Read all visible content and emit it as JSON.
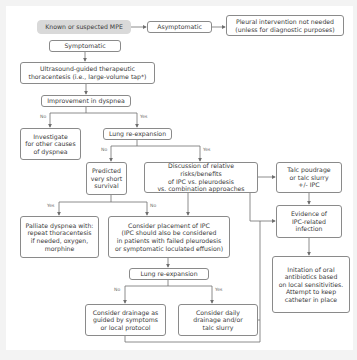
{
  "diagram": {
    "nodes": {
      "mpe": "Known or suspected MPE",
      "asymptomatic": "Asymptomatic",
      "no_intervention": "Pleural intervention not needed\n(unless for diagnostic purposes)",
      "symptomatic": "Symptomatic",
      "thoracentesis": "Ultrasound-guided therapeutic\nthoracentesis (i.e., large-volume tap*)",
      "improvement": "Improvement in dyspnea",
      "investigate": "Investigate\nfor other causes\nof dyspnea",
      "lung_reexp_1": "Lung re-expansion",
      "predicted_survival": "Predicted\nvery short\nsurvival",
      "discussion": "Discussion of relative risks/benefits\nof IPC vs. pleurodesis\nvs. combination approaches",
      "talc": "Talc poudrage\nor talc slurry\n+/- IPC",
      "evidence_infection": "Evidence of\nIPC-related\ninfection",
      "palliate": "Palliate dyspnea with:\nrepeat thoracentesis\nif needed, oxygen,\nmorphine",
      "consider_ipc": "Consider placement of IPC\n(IPC should also be considered\nin patients with failed pleurodesis\nor symptomatic loculated effusion)",
      "lung_reexp_2": "Lung re-expansion",
      "antibiotics": "Initation of oral\nantibiotics based\non local sensitivities.\nAttempt to keep\ncatheter in place",
      "drainage_guided": "Consider drainage as\nguided by symptoms\nor local protocol",
      "daily_drainage": "Consider daily\ndrainage and/or\ntalc slurry"
    },
    "edge_labels": {
      "improvement_no": "No",
      "improvement_yes": "Yes",
      "reexp1_no": "No",
      "reexp1_yes": "Yes",
      "survival_yes": "Yes",
      "survival_no": "No",
      "reexp2_no": "No",
      "reexp2_yes": "Yes"
    },
    "colors": {
      "line": "#6f6f6f",
      "border": "#8a8a8a",
      "start_fill": "#d9d9d9",
      "text": "#3a3a3a"
    }
  }
}
